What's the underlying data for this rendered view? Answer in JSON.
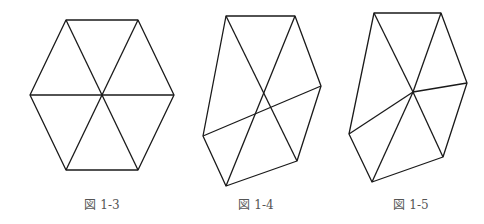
{
  "figures": [
    {
      "caption": "図 1-3",
      "caption_pos": [
        102,
        203
      ],
      "outline": [
        [
          66,
          20
        ],
        [
          138,
          20
        ],
        [
          174,
          95
        ],
        [
          138,
          170
        ],
        [
          66,
          170
        ],
        [
          30,
          95
        ]
      ],
      "edges": [
        [
          [
            66,
            20
          ],
          [
            138,
            170
          ]
        ],
        [
          [
            138,
            20
          ],
          [
            66,
            170
          ]
        ],
        [
          [
            30,
            95
          ],
          [
            174,
            95
          ]
        ]
      ]
    },
    {
      "caption": "図 1-4",
      "caption_pos": [
        256,
        203
      ],
      "outline": [
        [
          226,
          16
        ],
        [
          295,
          16
        ],
        [
          321,
          86
        ],
        [
          297,
          161
        ],
        [
          226,
          186
        ],
        [
          203,
          136
        ]
      ],
      "edges": [
        [
          [
            226,
            16
          ],
          [
            297,
            161
          ]
        ],
        [
          [
            295,
            16
          ],
          [
            226,
            186
          ]
        ],
        [
          [
            203,
            136
          ],
          [
            321,
            86
          ]
        ]
      ]
    },
    {
      "caption": "図 1-5",
      "caption_pos": [
        411,
        203
      ],
      "outline": [
        [
          374,
          13
        ],
        [
          441,
          13
        ],
        [
          467,
          83
        ],
        [
          443,
          157
        ],
        [
          372,
          182
        ],
        [
          349,
          134
        ]
      ],
      "edges": [
        [
          [
            374,
            13
          ],
          [
            413,
            92
          ]
        ],
        [
          [
            441,
            13
          ],
          [
            413,
            92
          ]
        ],
        [
          [
            467,
            83
          ],
          [
            413,
            92
          ]
        ],
        [
          [
            443,
            157
          ],
          [
            413,
            92
          ]
        ],
        [
          [
            372,
            182
          ],
          [
            413,
            92
          ]
        ],
        [
          [
            349,
            134
          ],
          [
            413,
            92
          ]
        ]
      ]
    }
  ],
  "style": {
    "stroke": "#1a1a1a",
    "stroke_width": 1.3
  }
}
